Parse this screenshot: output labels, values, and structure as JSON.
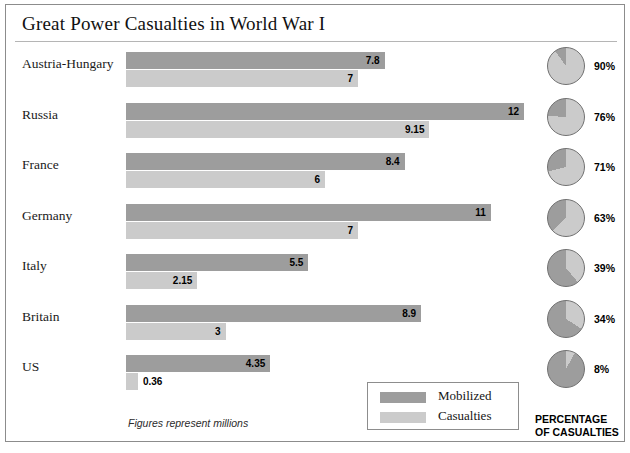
{
  "title": "Great Power Casualties in World War I",
  "footnote": "Figures represent millions",
  "percentage_caption_line1": "PERCENTAGE",
  "percentage_caption_line2": "OF CASUALTIES",
  "legend": {
    "mobilized_label": "Mobilized",
    "casualties_label": "Casualties"
  },
  "colors": {
    "mobilized": "#9d9d9d",
    "casualties": "#cbcbcb",
    "pie_light": "#cbcbcb",
    "pie_dark": "#9d9d9d",
    "frame": "#8c8c8c",
    "text": "#000000"
  },
  "chart_data": {
    "type": "bar",
    "title": "Great Power Casualties in World War I",
    "xlabel": "",
    "ylabel": "",
    "unit": "millions",
    "grid": false,
    "legend_position": "bottom-right",
    "xlim": [
      0,
      12
    ],
    "categories": [
      "Austria-Hungary",
      "Russia",
      "France",
      "Germany",
      "Italy",
      "Britain",
      "US"
    ],
    "series": [
      {
        "name": "Mobilized",
        "values": [
          7.8,
          12,
          8.4,
          11,
          5.5,
          8.9,
          4.35
        ]
      },
      {
        "name": "Casualties",
        "values": [
          7,
          9.15,
          6,
          7,
          2.15,
          3,
          0.36
        ]
      }
    ],
    "value_labels": {
      "Mobilized": [
        "7.8",
        "12",
        "8.4",
        "11",
        "5.5",
        "8.9",
        "4.35"
      ],
      "Casualties": [
        "7",
        "9.15",
        "6",
        "7",
        "2.15",
        "3",
        "0.36"
      ]
    },
    "pie_panel": {
      "type": "pie",
      "title": "PERCENTAGE OF CASUALTIES",
      "categories": [
        "Austria-Hungary",
        "Russia",
        "France",
        "Germany",
        "Italy",
        "Britain",
        "US"
      ],
      "values": [
        90,
        76,
        71,
        63,
        39,
        34,
        8
      ],
      "labels": [
        "90%",
        "76%",
        "71%",
        "63%",
        "39%",
        "34%",
        "8%"
      ]
    }
  },
  "rows": [
    {
      "country": "Austria-Hungary",
      "mobilized": "7.8",
      "casualties": "7",
      "pct": "90%"
    },
    {
      "country": "Russia",
      "mobilized": "12",
      "casualties": "9.15",
      "pct": "76%"
    },
    {
      "country": "France",
      "mobilized": "8.4",
      "casualties": "6",
      "pct": "71%"
    },
    {
      "country": "Germany",
      "mobilized": "11",
      "casualties": "7",
      "pct": "63%"
    },
    {
      "country": "Italy",
      "mobilized": "5.5",
      "casualties": "2.15",
      "pct": "39%"
    },
    {
      "country": "Britain",
      "mobilized": "8.9",
      "casualties": "3",
      "pct": "34%"
    },
    {
      "country": "US",
      "mobilized": "4.35",
      "casualties": "0.36",
      "pct": "8%"
    }
  ]
}
